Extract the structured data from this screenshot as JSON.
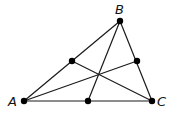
{
  "diagram": {
    "type": "triangle-medians",
    "vertices": [
      {
        "label": "A",
        "x": 24,
        "y": 101,
        "label_x": 8,
        "label_y": 106
      },
      {
        "label": "B",
        "x": 120,
        "y": 21,
        "label_x": 115,
        "label_y": 14
      },
      {
        "label": "C",
        "x": 152,
        "y": 101,
        "label_x": 157,
        "label_y": 106
      }
    ],
    "midpoints": [
      {
        "of": "AB",
        "x": 72,
        "y": 61
      },
      {
        "of": "BC",
        "x": 137,
        "y": 61
      },
      {
        "of": "AC",
        "x": 88,
        "y": 101
      }
    ],
    "stroke_color": "#1a1a1a",
    "point_color": "#000000"
  }
}
